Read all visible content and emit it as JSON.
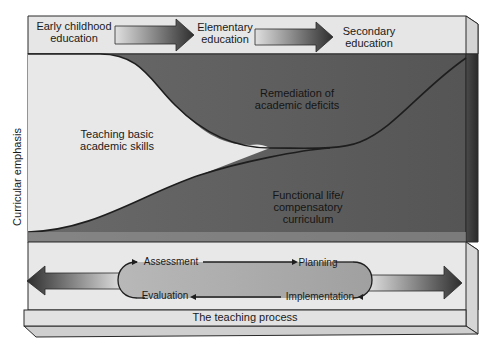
{
  "diagram": {
    "stages": [
      {
        "label_line1": "Early childhood",
        "label_line2": "education"
      },
      {
        "label_line1": "Elementary",
        "label_line2": "education"
      },
      {
        "label_line1": "Secondary",
        "label_line2": "education"
      }
    ],
    "y_axis_label": "Curricular emphasis",
    "regions": {
      "remediation": {
        "line1": "Remediation of",
        "line2": "academic deficits"
      },
      "basic_skills": {
        "line1": "Teaching basic",
        "line2": "academic skills"
      },
      "functional": {
        "line1": "Functional life/",
        "line2": "compensatory",
        "line3": "curriculum"
      }
    },
    "teaching_process": {
      "title": "The teaching process",
      "steps": [
        "Assessment",
        "Planning",
        "Implementation",
        "Evaluation"
      ]
    },
    "colors": {
      "light_panel": "#e4e4e4",
      "dark_region": "#5e5e5e",
      "basic_region": "#e8e8e8",
      "outline": "#2a2a2a",
      "arrow_dark": "#333333"
    }
  }
}
